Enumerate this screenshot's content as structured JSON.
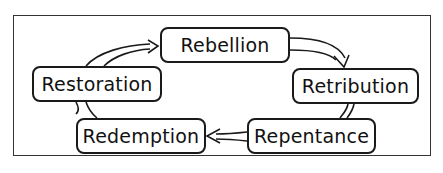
{
  "diagram": {
    "type": "cycle",
    "nodes": [
      {
        "id": "rebellion",
        "label": "Rebellion"
      },
      {
        "id": "retribution",
        "label": "Retribution"
      },
      {
        "id": "repentance",
        "label": "Repentance"
      },
      {
        "id": "redemption",
        "label": "Redemption"
      },
      {
        "id": "restoration",
        "label": "Restoration"
      }
    ],
    "edges": [
      {
        "from": "rebellion",
        "to": "retribution"
      },
      {
        "from": "retribution",
        "to": "repentance"
      },
      {
        "from": "repentance",
        "to": "redemption"
      },
      {
        "from": "redemption",
        "to": "restoration"
      },
      {
        "from": "restoration",
        "to": "rebellion"
      }
    ],
    "colors": {
      "stroke": "#1a1a1a",
      "background": "#ffffff"
    }
  }
}
